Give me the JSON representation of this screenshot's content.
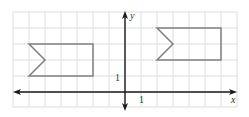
{
  "figure": {
    "type": "coordinate-grid-diagram",
    "axes": {
      "x_label": "x",
      "y_label": "y",
      "x_tick_label": "1",
      "y_tick_label": "1",
      "x_range": [
        -7,
        7
      ],
      "y_range": [
        -1,
        5
      ],
      "unit_px": 16,
      "origin_px": [
        125,
        92
      ]
    },
    "grid": {
      "visible": true,
      "color": "#d4d4d4"
    },
    "colors": {
      "axis": "#1a1a1a",
      "shape_stroke": "#808080",
      "label": "#333333"
    },
    "shapes": [
      {
        "name": "left-flag-shape",
        "vertices": [
          [
            -6,
            3
          ],
          [
            -2,
            3
          ],
          [
            -2,
            1
          ],
          [
            -6,
            1
          ],
          [
            -5,
            2
          ]
        ]
      },
      {
        "name": "right-flag-shape",
        "vertices": [
          [
            2,
            4
          ],
          [
            6,
            4
          ],
          [
            6,
            2
          ],
          [
            2,
            2
          ],
          [
            3,
            3
          ]
        ]
      }
    ]
  }
}
